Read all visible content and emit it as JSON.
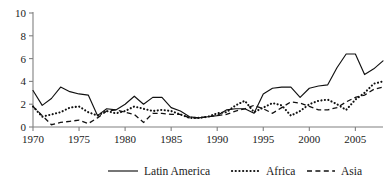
{
  "chart_data": {
    "type": "line",
    "title": "",
    "subtitle": "",
    "xlabel": "",
    "ylabel": "",
    "xlim": [
      1970,
      2008
    ],
    "ylim": [
      0,
      10
    ],
    "grid": false,
    "legend_position": "bottom",
    "x": [
      1970,
      1971,
      1972,
      1973,
      1974,
      1975,
      1976,
      1977,
      1978,
      1979,
      1980,
      1981,
      1982,
      1983,
      1984,
      1985,
      1986,
      1987,
      1988,
      1989,
      1990,
      1991,
      1992,
      1993,
      1994,
      1995,
      1996,
      1997,
      1998,
      1999,
      2000,
      2001,
      2002,
      2003,
      2004,
      2005,
      2006,
      2007,
      2008
    ],
    "xticks": [
      1970,
      1975,
      1980,
      1985,
      1990,
      1995,
      2000,
      2005
    ],
    "xtick_labels": [
      "1970",
      "1975",
      "1980",
      "1985",
      "1990",
      "1995",
      "2000",
      "2005"
    ],
    "yticks": [
      0,
      2,
      4,
      6,
      8,
      10
    ],
    "ytick_labels": [
      "0",
      "2",
      "4",
      "6",
      "8",
      "10"
    ],
    "series": [
      {
        "name": "Latin America",
        "style": "solid",
        "values": [
          3.2,
          1.9,
          2.5,
          3.5,
          3.1,
          2.9,
          2.8,
          1.0,
          1.6,
          1.5,
          2.0,
          2.7,
          2.0,
          2.6,
          2.6,
          1.7,
          1.4,
          0.9,
          0.8,
          0.9,
          1.0,
          1.5,
          1.6,
          1.6,
          1.2,
          2.9,
          3.4,
          3.5,
          3.5,
          2.6,
          3.4,
          3.6,
          3.7,
          5.2,
          6.4,
          6.4,
          4.6,
          5.1,
          5.8
        ]
      },
      {
        "name": "Africa",
        "style": "dotted",
        "values": [
          1.8,
          0.9,
          1.1,
          1.3,
          1.7,
          1.8,
          1.3,
          1.0,
          1.4,
          1.2,
          1.4,
          1.8,
          1.6,
          1.4,
          1.5,
          1.4,
          1.1,
          0.8,
          0.8,
          0.9,
          1.2,
          1.3,
          1.9,
          2.3,
          1.3,
          1.7,
          2.1,
          1.9,
          1.0,
          1.4,
          2.0,
          2.3,
          2.4,
          2.0,
          1.5,
          2.4,
          3.0,
          3.8,
          4.0
        ]
      },
      {
        "name": "Asia",
        "style": "dashed",
        "values": [
          1.8,
          1.0,
          0.2,
          0.4,
          0.5,
          0.6,
          0.3,
          0.8,
          1.4,
          1.5,
          1.3,
          1.1,
          0.4,
          1.2,
          1.2,
          1.1,
          1.1,
          0.8,
          0.8,
          0.9,
          1.0,
          1.1,
          1.4,
          1.6,
          1.9,
          1.6,
          1.2,
          1.7,
          2.2,
          2.1,
          1.8,
          1.5,
          1.5,
          1.7,
          2.2,
          2.6,
          2.8,
          3.3,
          3.5
        ]
      }
    ],
    "series_full": {
      "Latin America": [
        3.2,
        1.9,
        2.5,
        3.5,
        3.1,
        2.9,
        2.8,
        1.0,
        1.6,
        1.5,
        2.0,
        2.7,
        2.0,
        2.6,
        2.6,
        1.7,
        1.4,
        0.9,
        0.8,
        0.9,
        1.0,
        1.5,
        1.6,
        1.6,
        1.2,
        2.9,
        3.4,
        3.5,
        3.5,
        2.6,
        3.4,
        3.6,
        3.7,
        5.2,
        6.4,
        6.4,
        4.6,
        5.1,
        5.8
      ],
      "Africa": [
        1.8,
        0.9,
        1.1,
        1.3,
        1.7,
        1.8,
        1.3,
        1.0,
        1.4,
        1.2,
        1.4,
        1.8,
        1.6,
        1.4,
        1.5,
        1.4,
        1.1,
        0.8,
        0.8,
        0.9,
        1.2,
        1.3,
        1.9,
        2.3,
        1.3,
        1.7,
        2.1,
        1.9,
        1.0,
        1.4,
        2.0,
        2.3,
        2.4,
        2.0,
        1.5,
        2.4,
        3.0,
        3.8,
        4.0
      ],
      "Asia": [
        1.8,
        1.0,
        0.2,
        0.4,
        0.5,
        0.6,
        0.3,
        0.8,
        1.4,
        1.5,
        1.3,
        1.1,
        0.4,
        1.2,
        1.2,
        1.1,
        1.1,
        0.8,
        0.8,
        0.9,
        1.0,
        1.1,
        1.4,
        1.6,
        1.9,
        1.6,
        1.2,
        1.7,
        2.2,
        2.1,
        1.8,
        1.5,
        1.5,
        1.7,
        2.2,
        2.6,
        2.8,
        3.3,
        3.5
      ]
    }
  },
  "legend": {
    "items": [
      {
        "label": "Latin America",
        "style": "solid"
      },
      {
        "label": "Africa",
        "style": "dotted"
      },
      {
        "label": "Asia",
        "style": "dashed"
      }
    ]
  }
}
